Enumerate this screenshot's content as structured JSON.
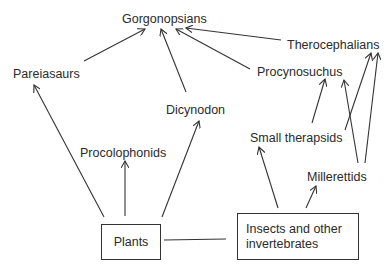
{
  "diagram": {
    "type": "food-web",
    "nodes": {
      "gorgonopsians": "Gorgonopsians",
      "therocephalians": "Therocephalians",
      "pareiasaurs": "Pareiasaurs",
      "procynosuchus": "Procynosuchus",
      "dicynodon": "Dicynodon",
      "procolophonids": "Procolophonids",
      "small_therapsids": "Small therapsids",
      "millerettids": "Millerettids",
      "plants": "Plants",
      "insects": "Insects and other invertebrates"
    },
    "edges": [
      {
        "from": "Plants",
        "to": "Pareiasaurs"
      },
      {
        "from": "Plants",
        "to": "Procolophonids"
      },
      {
        "from": "Plants",
        "to": "Dicynodon"
      },
      {
        "from": "Plants",
        "to": "Insects and other invertebrates",
        "arrow": false
      },
      {
        "from": "Insects and other invertebrates",
        "to": "Small therapsids"
      },
      {
        "from": "Insects and other invertebrates",
        "to": "Millerettids"
      },
      {
        "from": "Pareiasaurs",
        "to": "Gorgonopsians"
      },
      {
        "from": "Dicynodon",
        "to": "Gorgonopsians"
      },
      {
        "from": "Procynosuchus",
        "to": "Gorgonopsians"
      },
      {
        "from": "Therocephalians",
        "to": "Gorgonopsians"
      },
      {
        "from": "Small therapsids",
        "to": "Procynosuchus"
      },
      {
        "from": "Small therapsids",
        "to": "Therocephalians"
      },
      {
        "from": "Millerettids",
        "to": "Procynosuchus"
      },
      {
        "from": "Millerettids",
        "to": "Therocephalians"
      }
    ],
    "colors": {
      "line": "#333333",
      "text": "#2a2a2a",
      "background": "#ffffff"
    }
  }
}
